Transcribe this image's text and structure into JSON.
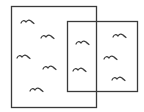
{
  "diagram": {
    "stroke_color": "#3a3a3a",
    "background": "#ffffff",
    "rectangles": [
      {
        "id": "left-set",
        "x": 11,
        "y": 6,
        "width": 85,
        "height": 101
      },
      {
        "id": "right-set",
        "x": 67,
        "y": 21,
        "width": 70,
        "height": 70
      }
    ],
    "birds": [
      {
        "region": "left-only",
        "x": 21,
        "y": 21
      },
      {
        "region": "left-only",
        "x": 41,
        "y": 36
      },
      {
        "region": "left-only",
        "x": 17,
        "y": 56
      },
      {
        "region": "left-only",
        "x": 43,
        "y": 67
      },
      {
        "region": "left-only",
        "x": 30,
        "y": 89
      },
      {
        "region": "overlap",
        "x": 76,
        "y": 42
      },
      {
        "region": "overlap",
        "x": 73,
        "y": 69
      },
      {
        "region": "right-only",
        "x": 113,
        "y": 35
      },
      {
        "region": "right-only",
        "x": 104,
        "y": 57
      },
      {
        "region": "right-only",
        "x": 112,
        "y": 78
      }
    ]
  }
}
